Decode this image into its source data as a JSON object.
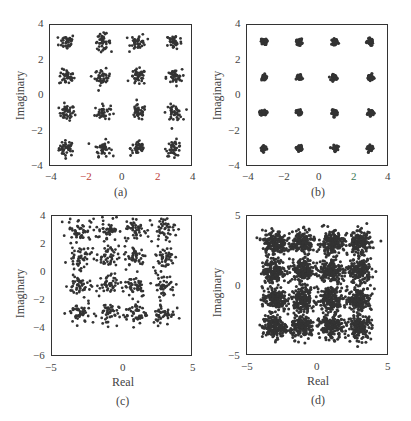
{
  "figure": {
    "panels": [
      {
        "id": "a",
        "caption": "(a)",
        "xlabel": "",
        "ylabel": "Imaginary",
        "xticks": [
          "−4",
          "−2",
          "0",
          "2",
          "4"
        ],
        "yticks": [
          "4",
          "2",
          "0",
          "−2",
          "−4"
        ]
      },
      {
        "id": "b",
        "caption": "(b)",
        "xlabel": "",
        "ylabel": "Imaginary",
        "xticks": [
          "−4",
          "−2",
          "0",
          "2",
          "4"
        ],
        "yticks": [
          "4",
          "2",
          "0",
          "−2",
          "−4"
        ]
      },
      {
        "id": "c",
        "caption": "(c)",
        "xlabel": "Real",
        "ylabel": "Imaginary",
        "xticks": [
          "−5",
          "0",
          "5"
        ],
        "yticks": [
          "4",
          "2",
          "0",
          "−2",
          "−4",
          "−6"
        ]
      },
      {
        "id": "d",
        "caption": "(d)",
        "xlabel": "Real",
        "ylabel": "Imaginary",
        "xticks": [
          "−5",
          "0",
          "5"
        ],
        "yticks": [
          "5",
          "0",
          "−5"
        ]
      }
    ]
  },
  "chart_data": [
    {
      "type": "scatter",
      "title": "(a)",
      "xlabel": "",
      "ylabel": "Imaginary",
      "xlim": [
        -4,
        4
      ],
      "ylim": [
        -4,
        4
      ],
      "description": "16-QAM constellation, moderate noise",
      "centers_x": [
        -3,
        -1,
        1,
        3
      ],
      "centers_y": [
        -3,
        -1,
        1,
        3
      ],
      "spread": 0.22,
      "points_per_cluster": 40,
      "color": "#333333"
    },
    {
      "type": "scatter",
      "title": "(b)",
      "xlabel": "",
      "ylabel": "Imaginary",
      "xlim": [
        -4,
        4
      ],
      "ylim": [
        -4,
        4
      ],
      "description": "16-QAM constellation, low noise",
      "centers_x": [
        -3,
        -1,
        1,
        3
      ],
      "centers_y": [
        -3,
        -1,
        1,
        3
      ],
      "spread": 0.08,
      "points_per_cluster": 40,
      "color": "#333333"
    },
    {
      "type": "scatter",
      "title": "(c)",
      "xlabel": "Real",
      "ylabel": "Imaginary",
      "xlim": [
        -5,
        5
      ],
      "ylim": [
        -6,
        4
      ],
      "description": "16-QAM constellation, higher noise",
      "centers_x": [
        -3,
        -1,
        1,
        3
      ],
      "centers_y": [
        -3,
        -1,
        1,
        3
      ],
      "spread": 0.4,
      "points_per_cluster": 45,
      "color": "#333333"
    },
    {
      "type": "scatter",
      "title": "(d)",
      "xlabel": "Real",
      "ylabel": "Imaginary",
      "xlim": [
        -5,
        5
      ],
      "ylim": [
        -5,
        5
      ],
      "description": "16-QAM constellation, many samples with heavy noise",
      "centers_x": [
        -3,
        -1,
        1,
        3
      ],
      "centers_y": [
        -3,
        -1,
        1,
        3
      ],
      "spread": 0.42,
      "points_per_cluster": 180,
      "color": "#333333"
    }
  ]
}
